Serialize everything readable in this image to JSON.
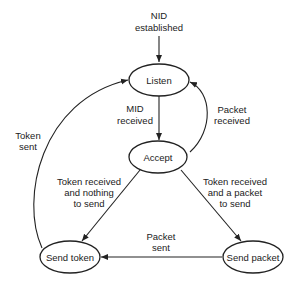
{
  "diagram": {
    "type": "state-diagram",
    "start_label": [
      "NID",
      "established"
    ],
    "states": {
      "listen": "Listen",
      "accept": "Accept",
      "send_token": "Send token",
      "send_packet": "Send packet"
    },
    "transitions": {
      "mid_received": [
        "MID",
        "received"
      ],
      "packet_received": [
        "Packet",
        "received"
      ],
      "token_sent": [
        "Token",
        "sent"
      ],
      "token_nothing": [
        "Token received",
        "and nothing",
        "to send"
      ],
      "token_packet": [
        "Token received",
        "and a packet",
        "to send"
      ],
      "packet_sent": [
        "Packet",
        "sent"
      ]
    }
  }
}
